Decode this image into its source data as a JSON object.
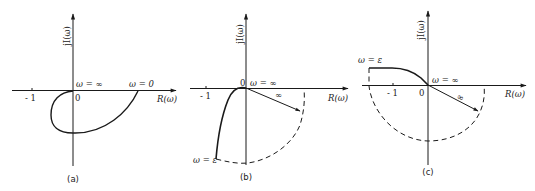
{
  "caption_top_cropped": "··················",
  "panels": [
    {
      "id": "a",
      "caption": "(a)",
      "y_axis_label": "jI(ω)",
      "x_axis_label": "R(ω)",
      "tick_minus_one": "- 1",
      "origin_label": "0",
      "omega_inf_label": "ω = ∞",
      "omega_zero_label": "ω = 0"
    },
    {
      "id": "b",
      "caption": "(b)",
      "y_axis_label": "jI(ω)",
      "x_axis_label": "R(ω)",
      "tick_minus_one": "- 1",
      "origin_label": "0",
      "omega_inf_label": "ω = ∞",
      "radius_label": "∞",
      "omega_eps_label": "ω = ε"
    },
    {
      "id": "c",
      "caption": "(c)",
      "y_axis_label": "jI(ω)",
      "x_axis_label": "R(ω)",
      "tick_minus_one": "- 1",
      "origin_label": "0",
      "omega_inf_label": "ω = ∞",
      "radius_label": "∞",
      "omega_eps_label": "ω = ε"
    }
  ],
  "colors": {
    "ink": "#1a1a1a",
    "background": "#ffffff"
  }
}
